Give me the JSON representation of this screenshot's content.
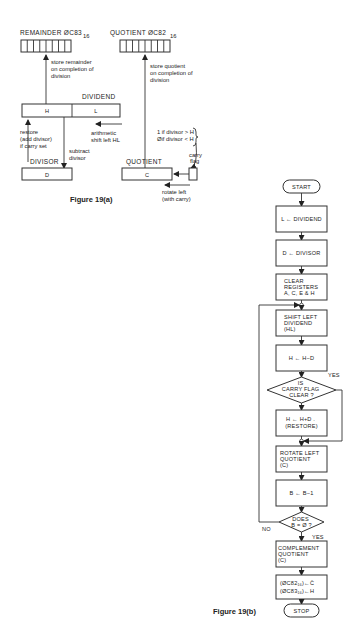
{
  "figure_a": {
    "caption": "Figure 19(a)",
    "remainder_label": "REMAINDER ØC83",
    "remainder_sub": "16",
    "quotient_mem_label": "QUOTIENT ØC82",
    "quotient_mem_sub": "16",
    "store_remainder": [
      "store remainder",
      "on completion of",
      "division"
    ],
    "store_quotient": [
      "store quotient",
      "on completion of",
      "division"
    ],
    "dividend_label": "DIVIDEND",
    "reg_h": "H",
    "reg_l": "L",
    "restore_note": [
      "restore",
      "(add divisor)",
      "if carry set"
    ],
    "subtract_note": [
      "subtract",
      "divisor"
    ],
    "shift_note": [
      "arithmetic",
      "shift left HL"
    ],
    "carry_rule": [
      "1 if divisor > H",
      "Øif divisor < H"
    ],
    "carry_flag": [
      "carry",
      "flag"
    ],
    "divisor_label": "DIVISOR",
    "reg_d": "D",
    "quotient_label": "QUOTIENT",
    "reg_c": "C",
    "rotate_note": [
      "rotate left",
      "(with carry)"
    ]
  },
  "figure_b": {
    "caption": "Figure 19(b)",
    "start": "START",
    "steps": {
      "load_dividend": "L ← DIVIDEND",
      "load_divisor": "D ← DIVISOR",
      "clear": [
        "CLEAR",
        "REGISTERS",
        "A, C, E & H"
      ],
      "shift": [
        "SHIFT LEFT",
        "DIVIDEND",
        "(HL)"
      ],
      "subtract": "H ← H−D",
      "carry_decision": [
        "IS",
        "CARRY FLAG",
        "CLEAR ?"
      ],
      "carry_yes": "YES",
      "restore": [
        "H ← H+D .",
        "(RESTORE)"
      ],
      "rotate": [
        "ROTATE LEFT",
        "QUOTIENT",
        "(C)"
      ],
      "decrement": "B ← B−1",
      "b_decision": [
        "DOES",
        "B = Ø ?"
      ],
      "b_no": "NO",
      "b_yes": "YES",
      "complement": [
        "COMPLEMENT",
        "QUOTIENT",
        "(C)"
      ],
      "store1": "(ØC82₁₆)←C̄",
      "store2": "(ØC83₁₆)←H"
    },
    "stop": "STOP"
  }
}
